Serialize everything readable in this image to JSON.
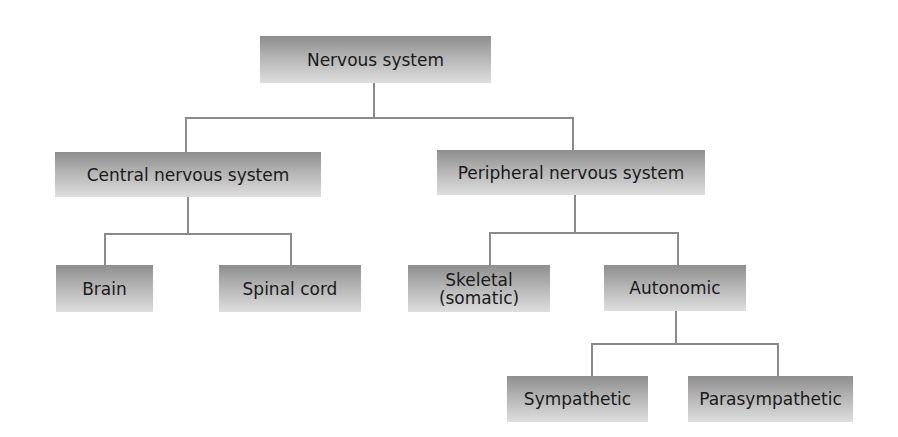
{
  "diagram": {
    "type": "hierarchy",
    "title": "Nervous system",
    "nodes": {
      "root": "Nervous system",
      "cns": "Central nervous system",
      "pns": "Peripheral nervous system",
      "brain": "Brain",
      "spinal_cord": "Spinal cord",
      "skeletal_line1": "Skeletal",
      "skeletal_line2": "(somatic)",
      "autonomic": "Autonomic",
      "sympathetic": "Sympathetic",
      "parasympathetic": "Parasympathetic"
    },
    "edges": [
      [
        "Nervous system",
        "Central nervous system"
      ],
      [
        "Nervous system",
        "Peripheral nervous system"
      ],
      [
        "Central nervous system",
        "Brain"
      ],
      [
        "Central nervous system",
        "Spinal cord"
      ],
      [
        "Peripheral nervous system",
        "Skeletal (somatic)"
      ],
      [
        "Peripheral nervous system",
        "Autonomic"
      ],
      [
        "Autonomic",
        "Sympathetic"
      ],
      [
        "Autonomic",
        "Parasympathetic"
      ]
    ],
    "colors": {
      "box_top": "#8e8e8e",
      "box_bottom": "#dedede",
      "connector": "#8a8a8a",
      "text": "#1a1a1a"
    }
  }
}
